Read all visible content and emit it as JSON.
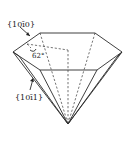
{
  "figure": {
    "labels": {
      "prism_face": "{10ī0}",
      "pyramid_face": "{10ī1}",
      "angle": "62°"
    },
    "colors": {
      "line": "#2a2a2a",
      "background": "#ffffff"
    }
  }
}
